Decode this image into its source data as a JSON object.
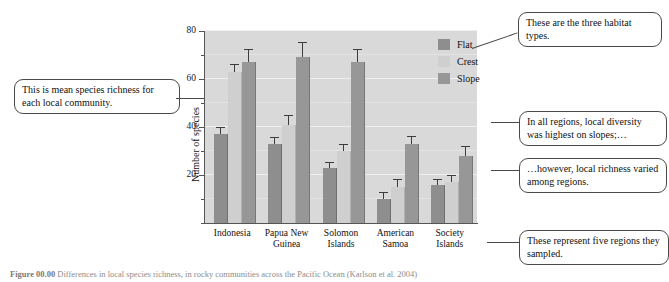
{
  "chart_data": {
    "type": "bar",
    "title": "",
    "xlabel": "",
    "ylabel": "Number of species",
    "ylim": [
      0,
      80
    ],
    "yticks": [
      0,
      10,
      20,
      30,
      40,
      50,
      60,
      70,
      80
    ],
    "ytick_labels": [
      "",
      "",
      "20",
      "",
      "40",
      "",
      "60",
      "",
      "80"
    ],
    "grid": true,
    "legend_position": "right-top",
    "categories": [
      "Indonesia",
      "Papua New Guinea",
      "Solomon Islands",
      "American Samoa",
      "Society Islands"
    ],
    "series": [
      {
        "name": "Flat",
        "color": "#8e8e8e",
        "values": [
          37,
          33,
          23,
          10,
          16
        ],
        "errors": [
          2.5,
          2.5,
          2.0,
          2.5,
          2.0
        ]
      },
      {
        "name": "Crest",
        "color": "#cfcfcf",
        "values": [
          63,
          41,
          30,
          15,
          17
        ],
        "errors": [
          3.0,
          3.5,
          2.5,
          3.0,
          2.5
        ]
      },
      {
        "name": "Slope",
        "color": "#979797",
        "values": [
          67,
          69,
          67,
          33,
          28
        ],
        "errors": [
          5.0,
          6.0,
          5.0,
          3.0,
          3.5
        ]
      }
    ]
  },
  "axis": {
    "y_title": "Number of species",
    "y_labels": {
      "t20": "20",
      "t40": "40",
      "t60": "60",
      "t80": "80"
    }
  },
  "legend": {
    "items": [
      {
        "label": "Flat"
      },
      {
        "label": "Crest"
      },
      {
        "label": "Slope"
      }
    ]
  },
  "xlabels": [
    {
      "line1": "Indonesia",
      "line2": ""
    },
    {
      "line1": "Papua New",
      "line2": "Guinea"
    },
    {
      "line1": "Solomon",
      "line2": "Islands"
    },
    {
      "line1": "American",
      "line2": "Samoa"
    },
    {
      "line1": "Society",
      "line2": "Islands"
    }
  ],
  "callouts": {
    "mean_richness": "This is mean species richness for each local community.",
    "habitat_types": "These are the three habitat types.",
    "slopes_highest": "In all regions, local diversity was highest on slopes;…",
    "varied_regions": "…however, local richness varied among regions.",
    "five_regions": "These represent five regions they sampled."
  },
  "caption": {
    "figure_number": "Figure 00.00",
    "text": "Differences in local species richness, in rocky communities across the Pacific Ocean (Karlson et al. 2004)"
  }
}
